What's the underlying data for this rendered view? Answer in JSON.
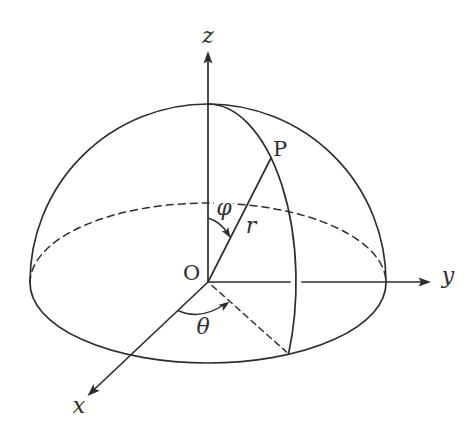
{
  "figure": {
    "kind": "spherical-coordinates-hemisphere-diagram",
    "background": "#ffffff",
    "ink": "#2e2e2e",
    "labels": {
      "z_axis": "z",
      "y_axis": "y",
      "x_axis": "x",
      "origin": "O",
      "point": "P",
      "radius": "r",
      "polar_angle": "φ",
      "azimuth_angle": "θ"
    }
  }
}
